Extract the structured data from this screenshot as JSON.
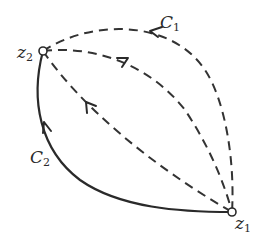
{
  "diagram": {
    "points": {
      "z1": {
        "label_main": "z",
        "label_sub": "1",
        "x": 232,
        "y": 212
      },
      "z2": {
        "label_main": "z",
        "label_sub": "2",
        "x": 43,
        "y": 51
      }
    },
    "curves": [
      {
        "id": "C1",
        "label_main": "C",
        "label_sub": "1",
        "style": "dashed",
        "direction": "z1-to-z2"
      },
      {
        "id": "middle",
        "label_main": "",
        "label_sub": "",
        "style": "dashed",
        "direction": "z1-to-z2"
      },
      {
        "id": "inner",
        "label_main": "",
        "label_sub": "",
        "style": "dashed",
        "direction": "z1-to-z2"
      },
      {
        "id": "C2",
        "label_main": "C",
        "label_sub": "2",
        "style": "solid",
        "direction": "z1-to-z2"
      }
    ],
    "colors": {
      "stroke": "#2a2a2a",
      "background": "#ffffff"
    }
  }
}
